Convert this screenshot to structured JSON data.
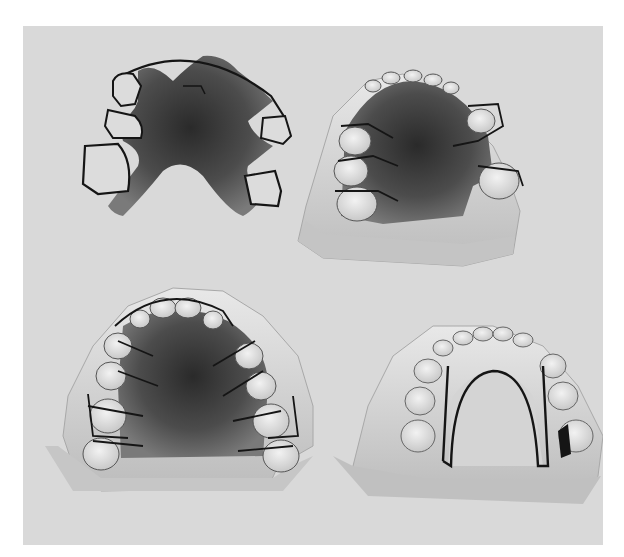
{
  "image": {
    "kind": "photograph",
    "description": "Four orthodontic removable appliances / dental plaster casts on a light gray background",
    "colors": {
      "background": "#d9d9d9",
      "acrylic": "#4a4a4a",
      "acrylic_dark": "#2e2e2e",
      "plaster": "#e6e6e6",
      "plaster_shadow": "#bdbdbd",
      "wire": "#151515"
    },
    "objects": [
      {
        "id": "appliance-top-left",
        "label": "removable acrylic plate with clasps and labial bow (off model)"
      },
      {
        "id": "cast-top-right",
        "label": "upper cast with acrylic plate and clasps"
      },
      {
        "id": "cast-bottom-left",
        "label": "upper cast with acrylic plate and multiple springs"
      },
      {
        "id": "cast-bottom-right",
        "label": "lower cast with lingual arch wire"
      }
    ]
  }
}
